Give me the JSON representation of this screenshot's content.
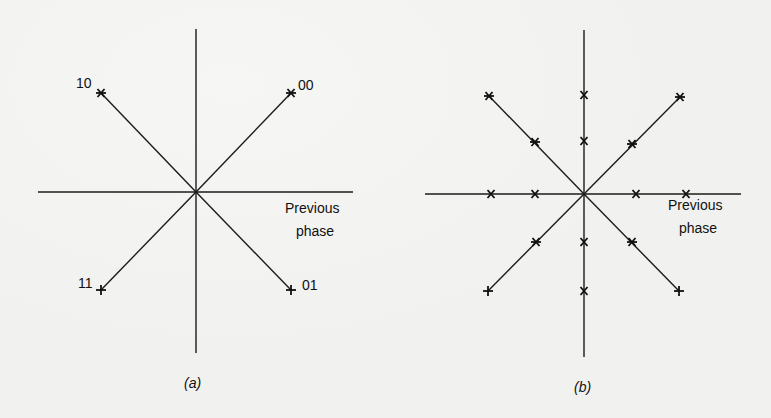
{
  "figure": {
    "panels": [
      {
        "id": "a",
        "caption": "(a)",
        "axis_label_line1": "Previous",
        "axis_label_line2": "phase",
        "points": [
          {
            "label": "10",
            "quadrant": "upper-left"
          },
          {
            "label": "00",
            "quadrant": "upper-right"
          },
          {
            "label": "11",
            "quadrant": "lower-left"
          },
          {
            "label": "01",
            "quadrant": "lower-right"
          }
        ]
      },
      {
        "id": "b",
        "caption": "(b)",
        "axis_label_line1": "Previous",
        "axis_label_line2": "phase",
        "marker_count": 16
      }
    ]
  },
  "colors": {
    "ink": "#1b1b1b",
    "paper": "#f1f1ef"
  }
}
